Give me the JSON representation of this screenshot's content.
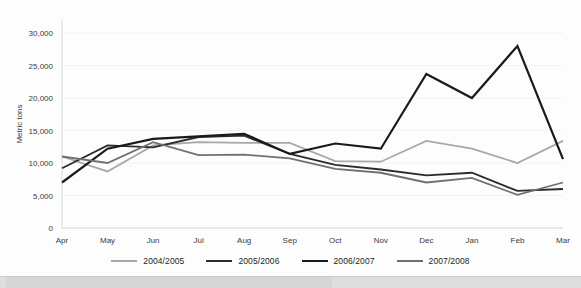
{
  "chart_data": {
    "type": "line",
    "title": "",
    "subtitle": "",
    "xlabel": "",
    "ylabel": "Metric tons",
    "categories": [
      "Apr",
      "May",
      "Jun",
      "Jul",
      "Aug",
      "Sep",
      "Oct",
      "Nov",
      "Dec",
      "Jan",
      "Feb",
      "Mar"
    ],
    "ylim": [
      0,
      32000
    ],
    "yticks": [
      0,
      5000,
      10000,
      15000,
      20000,
      25000,
      30000
    ],
    "ytick_labels": [
      "0",
      "5,000",
      "10,000",
      "15,000",
      "20,000",
      "25,000",
      "30,000"
    ],
    "grid": true,
    "legend_position": "bottom",
    "series": [
      {
        "name": "2004/2005",
        "color": "#a8a8a8",
        "width": 1.8,
        "values": [
          11000,
          8700,
          12700,
          13200,
          13100,
          13100,
          10300,
          10200,
          13400,
          12200,
          10000,
          13400
        ]
      },
      {
        "name": "2005/2006",
        "color": "#2b2b2b",
        "width": 1.8,
        "values": [
          9200,
          12700,
          12400,
          14000,
          14200,
          11400,
          9700,
          9000,
          8100,
          8500,
          5700,
          6000
        ]
      },
      {
        "name": "2006/2007",
        "color": "#1a1a1a",
        "width": 2.2,
        "values": [
          7000,
          12200,
          13700,
          14100,
          14500,
          11400,
          13000,
          12200,
          23700,
          20000,
          28000,
          10600
        ]
      },
      {
        "name": "2007/2008",
        "color": "#707070",
        "width": 1.8,
        "values": [
          11000,
          10000,
          13200,
          11200,
          11300,
          10700,
          9100,
          8500,
          7000,
          7700,
          5100,
          7000
        ]
      }
    ]
  },
  "legend": {
    "items": [
      {
        "label": "2004/2005",
        "color": "#a8a8a8"
      },
      {
        "label": "2005/2006",
        "color": "#2b2b2b"
      },
      {
        "label": "2006/2007",
        "color": "#1a1a1a"
      },
      {
        "label": "2007/2008",
        "color": "#707070"
      }
    ]
  }
}
